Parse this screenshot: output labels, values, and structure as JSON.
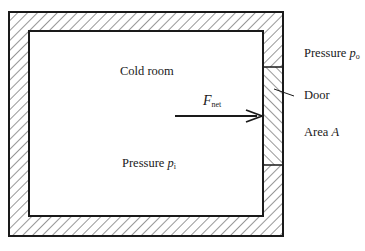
{
  "diagram": {
    "room_label": "Cold room",
    "inside_pressure": {
      "text": "Pressure ",
      "symbol": "p",
      "sub": "i"
    },
    "outside_pressure": {
      "text": "Pressure ",
      "symbol": "p",
      "sub": "o"
    },
    "door_label": "Door",
    "area_label": {
      "text": "Area ",
      "symbol": "A"
    },
    "force_label": {
      "symbol": "F",
      "sub": "net"
    }
  },
  "colors": {
    "line": "#1a1a1a",
    "background": "#ffffff"
  }
}
